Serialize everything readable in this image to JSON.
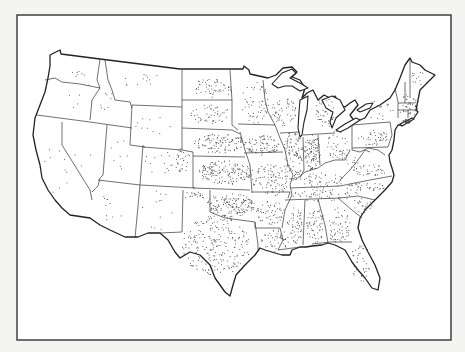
{
  "map": {
    "title": "",
    "type": "dot-density",
    "region": "Contiguous United States",
    "colors": {
      "background": "#ffffff",
      "outline": "#222222",
      "dots": "#444444",
      "frame": "#333333"
    },
    "frame": {
      "x": 17,
      "y": 15,
      "width": 434,
      "height": 325
    },
    "legend": null,
    "density_regions": [
      {
        "name": "Washington",
        "cx": 82,
        "cy": 78,
        "rx": 15,
        "ry": 8,
        "count": 8
      },
      {
        "name": "Oregon",
        "cx": 70,
        "cy": 100,
        "rx": 14,
        "ry": 8,
        "count": 4
      },
      {
        "name": "Idaho",
        "cx": 105,
        "cy": 100,
        "rx": 8,
        "ry": 15,
        "count": 8
      },
      {
        "name": "Montana",
        "cx": 150,
        "cy": 80,
        "rx": 28,
        "ry": 10,
        "count": 12
      },
      {
        "name": "Wyoming",
        "cx": 155,
        "cy": 125,
        "rx": 20,
        "ry": 12,
        "count": 10
      },
      {
        "name": "California",
        "cx": 55,
        "cy": 170,
        "rx": 14,
        "ry": 25,
        "count": 10
      },
      {
        "name": "Nevada",
        "cx": 85,
        "cy": 150,
        "rx": 12,
        "ry": 18,
        "count": 3
      },
      {
        "name": "Utah",
        "cx": 120,
        "cy": 155,
        "rx": 12,
        "ry": 15,
        "count": 8
      },
      {
        "name": "Arizona",
        "cx": 112,
        "cy": 208,
        "rx": 16,
        "ry": 15,
        "count": 10
      },
      {
        "name": "Colorado",
        "cx": 165,
        "cy": 162,
        "rx": 22,
        "ry": 12,
        "count": 18
      },
      {
        "name": "Colorado East",
        "cx": 182,
        "cy": 160,
        "rx": 8,
        "ry": 12,
        "count": 28
      },
      {
        "name": "New Mexico",
        "cx": 158,
        "cy": 210,
        "rx": 17,
        "ry": 20,
        "count": 12
      },
      {
        "name": "North Dakota",
        "cx": 212,
        "cy": 88,
        "rx": 20,
        "ry": 10,
        "count": 55
      },
      {
        "name": "South Dakota",
        "cx": 210,
        "cy": 114,
        "rx": 20,
        "ry": 10,
        "count": 50
      },
      {
        "name": "Nebraska",
        "cx": 220,
        "cy": 143,
        "rx": 26,
        "ry": 10,
        "count": 110
      },
      {
        "name": "Kansas",
        "cx": 225,
        "cy": 172,
        "rx": 28,
        "ry": 12,
        "count": 160
      },
      {
        "name": "Oklahoma",
        "cx": 230,
        "cy": 205,
        "rx": 25,
        "ry": 12,
        "count": 160
      },
      {
        "name": "Oklahoma Panhandle",
        "cx": 195,
        "cy": 195,
        "rx": 12,
        "ry": 4,
        "count": 20
      },
      {
        "name": "Texas",
        "cx": 215,
        "cy": 245,
        "rx": 35,
        "ry": 30,
        "count": 230
      },
      {
        "name": "Minnesota",
        "cx": 255,
        "cy": 102,
        "rx": 14,
        "ry": 22,
        "count": 55
      },
      {
        "name": "Iowa",
        "cx": 262,
        "cy": 145,
        "rx": 18,
        "ry": 10,
        "count": 85
      },
      {
        "name": "Missouri",
        "cx": 270,
        "cy": 180,
        "rx": 18,
        "ry": 16,
        "count": 95
      },
      {
        "name": "Arkansas",
        "cx": 270,
        "cy": 212,
        "rx": 14,
        "ry": 12,
        "count": 55
      },
      {
        "name": "Louisiana",
        "cx": 275,
        "cy": 240,
        "rx": 14,
        "ry": 12,
        "count": 50
      },
      {
        "name": "Wisconsin",
        "cx": 283,
        "cy": 112,
        "rx": 13,
        "ry": 15,
        "count": 55
      },
      {
        "name": "Illinois",
        "cx": 293,
        "cy": 155,
        "rx": 10,
        "ry": 25,
        "count": 110
      },
      {
        "name": "Michigan",
        "cx": 325,
        "cy": 112,
        "rx": 10,
        "ry": 15,
        "count": 45
      },
      {
        "name": "Indiana",
        "cx": 312,
        "cy": 152,
        "rx": 8,
        "ry": 18,
        "count": 100
      },
      {
        "name": "Ohio",
        "cx": 338,
        "cy": 145,
        "rx": 12,
        "ry": 15,
        "count": 45
      },
      {
        "name": "Kentucky",
        "cx": 322,
        "cy": 180,
        "rx": 22,
        "ry": 8,
        "count": 50
      },
      {
        "name": "Tennessee",
        "cx": 322,
        "cy": 195,
        "rx": 30,
        "ry": 6,
        "count": 55
      },
      {
        "name": "Mississippi",
        "cx": 295,
        "cy": 225,
        "rx": 8,
        "ry": 18,
        "count": 55
      },
      {
        "name": "Alabama",
        "cx": 315,
        "cy": 225,
        "rx": 9,
        "ry": 18,
        "count": 60
      },
      {
        "name": "Georgia",
        "cx": 338,
        "cy": 225,
        "rx": 12,
        "ry": 18,
        "count": 60
      },
      {
        "name": "Florida",
        "cx": 360,
        "cy": 262,
        "rx": 10,
        "ry": 20,
        "count": 40
      },
      {
        "name": "South Carolina",
        "cx": 362,
        "cy": 205,
        "rx": 10,
        "ry": 8,
        "count": 25
      },
      {
        "name": "North Carolina",
        "cx": 365,
        "cy": 188,
        "rx": 22,
        "ry": 6,
        "count": 40
      },
      {
        "name": "Virginia",
        "cx": 368,
        "cy": 170,
        "rx": 18,
        "ry": 6,
        "count": 35
      },
      {
        "name": "West Virginia",
        "cx": 352,
        "cy": 163,
        "rx": 7,
        "ry": 7,
        "count": 12
      },
      {
        "name": "Pennsylvania",
        "cx": 375,
        "cy": 138,
        "rx": 17,
        "ry": 8,
        "count": 40
      },
      {
        "name": "New York",
        "cx": 378,
        "cy": 110,
        "rx": 15,
        "ry": 10,
        "count": 18
      },
      {
        "name": "New England",
        "cx": 408,
        "cy": 105,
        "rx": 10,
        "ry": 12,
        "count": 40
      },
      {
        "name": "Maine",
        "cx": 418,
        "cy": 75,
        "rx": 8,
        "ry": 12,
        "count": 12
      },
      {
        "name": "Long Island",
        "cx": 406,
        "cy": 121,
        "rx": 5,
        "ry": 2,
        "count": 40
      }
    ]
  }
}
